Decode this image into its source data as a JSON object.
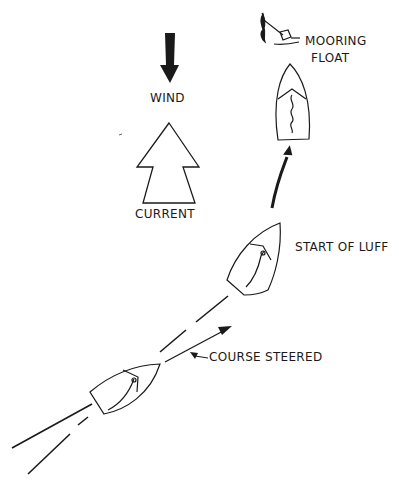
{
  "diagram": {
    "labels": {
      "wind": "WIND",
      "current": "CURRENT",
      "mooring_float_line1": "MOORING",
      "mooring_float_line2": "FLOAT",
      "start_of_luff": "START OF LUFF",
      "course_steered": "COURSE STEERED"
    },
    "colors": {
      "ink": "#1a1a1a",
      "background": "#ffffff"
    },
    "icons": [
      "wind-arrow-icon",
      "current-arrow-icon",
      "mooring-float-icon",
      "sailboat-icon"
    ]
  }
}
